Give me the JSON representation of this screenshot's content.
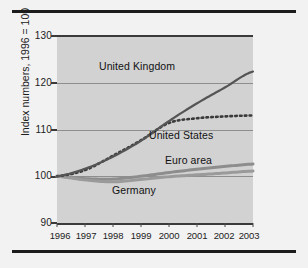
{
  "figure": {
    "background_color": "#f2f2f2",
    "plot_background_color": "#d2d2d2",
    "rule_color": "#1c1c1c"
  },
  "axis": {
    "y_title": "Index numbers, 1996 = 100",
    "y_ticks": [
      "130",
      "120",
      "110",
      "100",
      "90"
    ],
    "x_ticks": [
      "1996",
      "1997",
      "1998",
      "1999",
      "2000",
      "2001",
      "2002",
      "2003"
    ]
  },
  "labels": {
    "united_kingdom": "United Kingdom",
    "united_states": "United States",
    "euro_area": "Euro area",
    "germany": "Germany"
  },
  "chart_data": {
    "type": "line",
    "title": "",
    "xlabel": "",
    "ylabel": "Index numbers, 1996 = 100",
    "x": [
      1996,
      1997,
      1998,
      1999,
      2000,
      2001,
      2002,
      2003
    ],
    "xlim": [
      1996,
      2003
    ],
    "ylim": [
      90,
      130
    ],
    "yticks": [
      90,
      100,
      110,
      120,
      130
    ],
    "xticks": [
      1996,
      1997,
      1998,
      1999,
      2000,
      2001,
      2002,
      2003
    ],
    "grid": true,
    "legend": "inline-annotations",
    "series": [
      {
        "name": "United Kingdom",
        "style": "solid",
        "color": "#555555",
        "width": 2.2,
        "values": [
          100.0,
          101.6,
          104.2,
          107.6,
          111.8,
          115.6,
          119.0,
          122.4
        ]
      },
      {
        "name": "United States",
        "style": "dotted",
        "color": "#3a3a3a",
        "width": 2.6,
        "values": [
          100.0,
          101.3,
          104.4,
          107.7,
          111.4,
          112.4,
          112.8,
          113.0
        ]
      },
      {
        "name": "Euro area",
        "style": "solid",
        "color": "#8d8d8d",
        "width": 3.0,
        "values": [
          100.0,
          99.5,
          99.4,
          100.0,
          100.8,
          101.5,
          102.1,
          102.6
        ]
      },
      {
        "name": "Germany",
        "style": "solid",
        "color": "#9a9a9a",
        "width": 3.0,
        "values": [
          100.0,
          99.2,
          98.8,
          99.3,
          99.9,
          100.3,
          100.7,
          101.1
        ]
      }
    ]
  }
}
